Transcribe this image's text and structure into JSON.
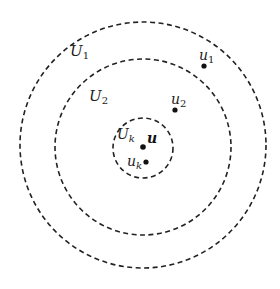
{
  "diagram": {
    "type": "nested neighborhoods",
    "rings": [
      {
        "id": "U1",
        "label": "U",
        "sub": "1",
        "cx": 143,
        "cy": 145,
        "r": 123,
        "label_x": 70,
        "label_y": 56
      },
      {
        "id": "U2",
        "label": "U",
        "sub": "2",
        "cx": 143,
        "cy": 147,
        "r": 88,
        "label_x": 89,
        "label_y": 101
      },
      {
        "id": "Uk",
        "label": "U",
        "sub": "k",
        "cx": 143,
        "cy": 148,
        "r": 30,
        "label_x": 117,
        "label_y": 139
      }
    ],
    "points": [
      {
        "id": "u1",
        "label": "u",
        "sub": "1",
        "x": 204,
        "y": 65,
        "label_x": 200,
        "label_y": 60
      },
      {
        "id": "u2",
        "label": "u",
        "sub": "2",
        "x": 175,
        "y": 110,
        "label_x": 171,
        "label_y": 104
      },
      {
        "id": "u",
        "label": "u",
        "sub": "",
        "x": 143,
        "y": 147,
        "label_x": 147,
        "label_y": 143
      },
      {
        "id": "uk",
        "label": "u",
        "sub": "k",
        "x": 146,
        "y": 162,
        "label_x": 128,
        "label_y": 166
      }
    ]
  },
  "labels": {
    "U1": "U",
    "U1_sub": "1",
    "U2": "U",
    "U2_sub": "2",
    "Uk": "U",
    "Uk_sub": "k",
    "u1": "u",
    "u1_sub": "1",
    "u2": "u",
    "u2_sub": "2",
    "u": "u",
    "uk": "u",
    "uk_sub": "k"
  }
}
